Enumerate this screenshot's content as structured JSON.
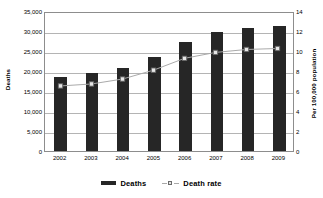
{
  "chart_data": {
    "type": "bar",
    "title": "",
    "subtitle": "",
    "xlabel": "",
    "ylabel": "Deaths",
    "y2label": "Per 100,000 population",
    "categories": [
      "2002",
      "2003",
      "2004",
      "2005",
      "2006",
      "2007",
      "2008",
      "2009"
    ],
    "series": [
      {
        "name": "Deaths",
        "type": "bar",
        "axis": "left",
        "color": "#262626",
        "values": [
          18500,
          19400,
          20800,
          23500,
          27300,
          29700,
          30800,
          31300
        ]
      },
      {
        "name": "Death rate",
        "type": "line",
        "axis": "right",
        "color": "#a9a9a9",
        "marker": "square",
        "values": [
          6.6,
          6.8,
          7.3,
          8.2,
          9.4,
          10.0,
          10.3,
          10.4
        ]
      }
    ],
    "ylim": [
      0,
      35000
    ],
    "y2lim": [
      0,
      14
    ],
    "yticks": [
      0,
      5000,
      10000,
      15000,
      20000,
      25000,
      30000,
      35000
    ],
    "ytick_labels": [
      "0",
      "5,000",
      "10,000",
      "15,000",
      "20,000",
      "25,000",
      "30,000",
      "35,000"
    ],
    "y2ticks": [
      0,
      2,
      4,
      6,
      8,
      10,
      12,
      14
    ],
    "y2tick_labels": [
      "0",
      "2",
      "4",
      "6",
      "8",
      "10",
      "12",
      "14"
    ],
    "grid": true,
    "grid_axis": "y",
    "legend_position": "bottom",
    "legend_entries": [
      "Deaths",
      "Death rate"
    ],
    "background": "#ffffff",
    "plot_border_color": "#8d8d8d",
    "gridline_color": "#b4b4b4"
  }
}
